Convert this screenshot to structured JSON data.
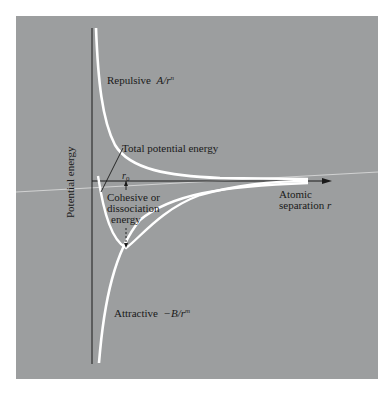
{
  "figure": {
    "background_color": "#9c9e9f",
    "curve_color": "#ffffff",
    "axis_color": "#1a1a1a",
    "y_axis_label": "Potential energy",
    "x_axis_label_line1": "Atomic",
    "x_axis_label_line2": "separation",
    "x_axis_symbol": "r",
    "labels": {
      "repulsive_text": "Repulsive",
      "repulsive_formula": "A/r",
      "repulsive_exponent": "n",
      "total_text": "Total potential energy",
      "equilibrium_symbol": "r",
      "equilibrium_subscript": "0",
      "cohesive_line1": "Cohesive or",
      "cohesive_line2": "dissociation",
      "cohesive_line3": "energy",
      "attractive_text": "Attractive",
      "attractive_formula": "−B/r",
      "attractive_exponent": "m"
    },
    "curves": [
      {
        "name": "Repulsive",
        "formula": "A/r^n",
        "sign": "positive"
      },
      {
        "name": "Attractive",
        "formula": "-B/r^m",
        "sign": "negative"
      },
      {
        "name": "Total potential energy",
        "formula": "A/r^n - B/r^m",
        "has_minimum_at": "r0"
      }
    ]
  }
}
